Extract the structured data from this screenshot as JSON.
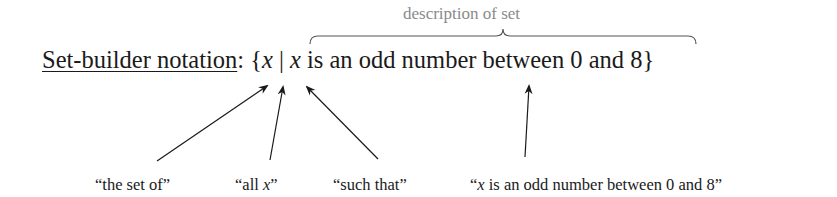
{
  "diagram": {
    "title": "Set-builder notation",
    "heading_label": "Set-builder notation",
    "colon": ":",
    "notation": {
      "open_brace": "{",
      "variable": "x",
      "separator": "|",
      "condition_variable": "x",
      "condition_text": " is an odd number between 0 and 8",
      "close_brace": "}"
    },
    "brace_annotation": {
      "label": "description of set",
      "color": "#8a8a8a"
    },
    "arrow_labels": [
      {
        "id": "the-set-of",
        "open_quote": "“",
        "text": "the set of",
        "close_quote": "”",
        "points_to": "{"
      },
      {
        "id": "all-x",
        "open_quote": "“",
        "text": "all ",
        "italic": "x",
        "close_quote": "”",
        "points_to": "x"
      },
      {
        "id": "such-that",
        "open_quote": "“",
        "text": "such that",
        "close_quote": "”",
        "points_to": "|"
      },
      {
        "id": "condition",
        "open_quote": "“",
        "italic": "x",
        "text": " is an odd number between 0 and 8",
        "close_quote": "”",
        "points_to": "x is an odd number between 0 and 8"
      }
    ],
    "colors": {
      "text": "#1a1a1a",
      "arrows": "#1a1a1a",
      "annotation": "#8a8a8a"
    }
  }
}
